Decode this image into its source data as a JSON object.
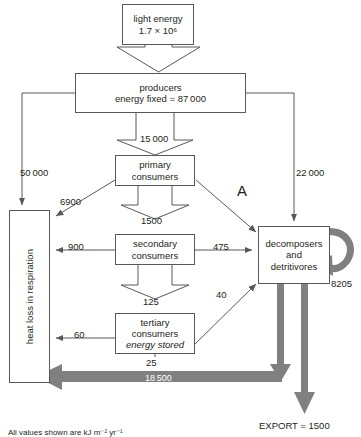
{
  "diagram": {
    "caption": "All values shown are kJ m⁻² yr⁻¹",
    "annotation_label": "A",
    "colors": {
      "outline": "#58585a",
      "text": "#231f20",
      "thick_arrow": "#808082",
      "background": "#ffffff"
    },
    "nodes": [
      {
        "id": "light_energy",
        "lines": [
          "light energy",
          "1.7 × 10⁶"
        ]
      },
      {
        "id": "producers",
        "lines": [
          "producers",
          "energy fixed = 87 000"
        ]
      },
      {
        "id": "primary_consumers",
        "lines": [
          "primary",
          "consumers"
        ]
      },
      {
        "id": "secondary_consumers",
        "lines": [
          "secondary",
          "consumers"
        ]
      },
      {
        "id": "tertiary_consumers",
        "lines": [
          "tertiary",
          "consumers",
          "energy stored"
        ]
      },
      {
        "id": "decomposers",
        "lines": [
          "decomposers",
          "and",
          "detritivores"
        ]
      },
      {
        "id": "heat_loss",
        "lines": [
          "heat loss in respiration"
        ]
      }
    ],
    "flows": [
      {
        "id": "producers_to_primary",
        "value": "15 000",
        "from": "producers",
        "to": "primary_consumers"
      },
      {
        "id": "producers_to_heat",
        "value": "50 000",
        "from": "producers",
        "to": "heat_loss"
      },
      {
        "id": "producers_to_decomposers",
        "value": "22 000",
        "from": "producers",
        "to": "decomposers"
      },
      {
        "id": "primary_to_heat",
        "value": "6900",
        "from": "primary_consumers",
        "to": "heat_loss"
      },
      {
        "id": "primary_to_secondary",
        "value": "1500",
        "from": "primary_consumers",
        "to": "secondary_consumers"
      },
      {
        "id": "primary_to_decomposers",
        "value": "",
        "from": "primary_consumers",
        "to": "decomposers"
      },
      {
        "id": "secondary_to_heat",
        "value": "900",
        "from": "secondary_consumers",
        "to": "heat_loss"
      },
      {
        "id": "secondary_to_decomposers",
        "value": "475",
        "from": "secondary_consumers",
        "to": "decomposers"
      },
      {
        "id": "secondary_to_tertiary",
        "value": "125",
        "from": "secondary_consumers",
        "to": "tertiary_consumers"
      },
      {
        "id": "tertiary_to_decomposers",
        "value": "40",
        "from": "tertiary_consumers",
        "to": "decomposers"
      },
      {
        "id": "tertiary_to_heat",
        "value": "60",
        "from": "tertiary_consumers",
        "to": "heat_loss"
      },
      {
        "id": "tertiary_energy_stored",
        "value": "25",
        "from": "tertiary_consumers",
        "to": "stored"
      },
      {
        "id": "decomposers_self_loop",
        "value": "8205",
        "from": "decomposers",
        "to": "decomposers"
      },
      {
        "id": "decomposers_to_heat",
        "value": "18 500",
        "from": "decomposers",
        "to": "heat_loss"
      },
      {
        "id": "decomposers_export",
        "value": "EXPORT = 1500",
        "from": "decomposers",
        "to": "export"
      }
    ]
  }
}
